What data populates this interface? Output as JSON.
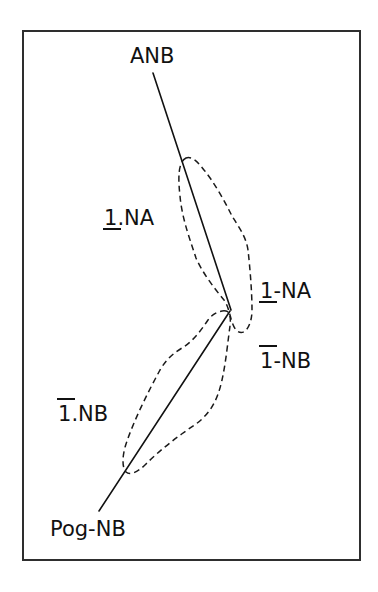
{
  "diagram": {
    "title": "",
    "frame": {
      "x": 23,
      "y": 31,
      "width": 337,
      "height": 529,
      "stroke": "#2e2e2e"
    },
    "labels": {
      "anb": {
        "text": "ANB"
      },
      "u1_na_angle": {
        "digit": "1",
        "mark": "underline",
        "suffix": ".NA"
      },
      "u1_na_distance": {
        "digit": "1",
        "mark": "underline",
        "suffix": "-NA"
      },
      "l1_nb_distance": {
        "digit": "1",
        "mark": "overline",
        "suffix": "-NB"
      },
      "l1_nb_angle": {
        "digit": "1",
        "mark": "overline",
        "suffix": ".NB"
      },
      "pog_nb": {
        "text": "Pog-NB"
      }
    },
    "lines": [
      {
        "name": "upper-line",
        "from": [
          153,
          73
        ],
        "to": [
          231,
          310
        ]
      },
      {
        "name": "lower-line",
        "from": [
          229,
          312
        ],
        "to": [
          99,
          510
        ]
      }
    ],
    "regions": [
      {
        "name": "upper-incisor-region",
        "style": "dashed"
      },
      {
        "name": "lower-incisor-region",
        "style": "dashed"
      }
    ],
    "colors": {
      "ink": "#111111",
      "frame": "#2e2e2e",
      "background": "#ffffff"
    }
  }
}
